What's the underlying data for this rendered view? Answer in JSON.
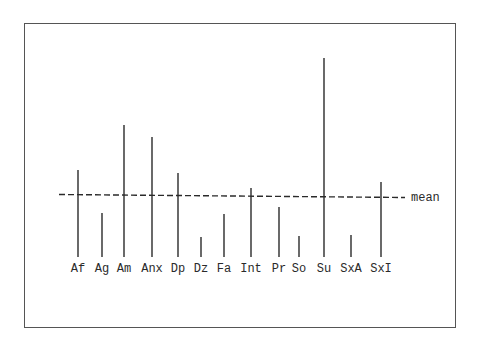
{
  "chart_data": {
    "type": "bar",
    "style": "spike/needle plot with reference line",
    "title": "",
    "xlabel": "",
    "ylabel": "",
    "categories": [
      "Af",
      "Ag",
      "Am",
      "Anx",
      "Dp",
      "Dz",
      "Fa",
      "Int",
      "Pr",
      "So",
      "Su",
      "SxA",
      "SxI"
    ],
    "values": [
      87,
      44,
      132,
      120,
      84,
      20,
      43,
      69,
      50,
      21,
      199,
      22,
      75
    ],
    "units": "relative (no y-axis shown; estimated from pixel heights above baseline)",
    "reference_line": {
      "label": "mean",
      "value": 61,
      "style": "dashed"
    },
    "grid": false,
    "legend": null,
    "ylim": [
      0,
      210
    ]
  },
  "colors": {
    "line": "#2a2a2a",
    "frame": "#555555",
    "background": "#ffffff"
  }
}
